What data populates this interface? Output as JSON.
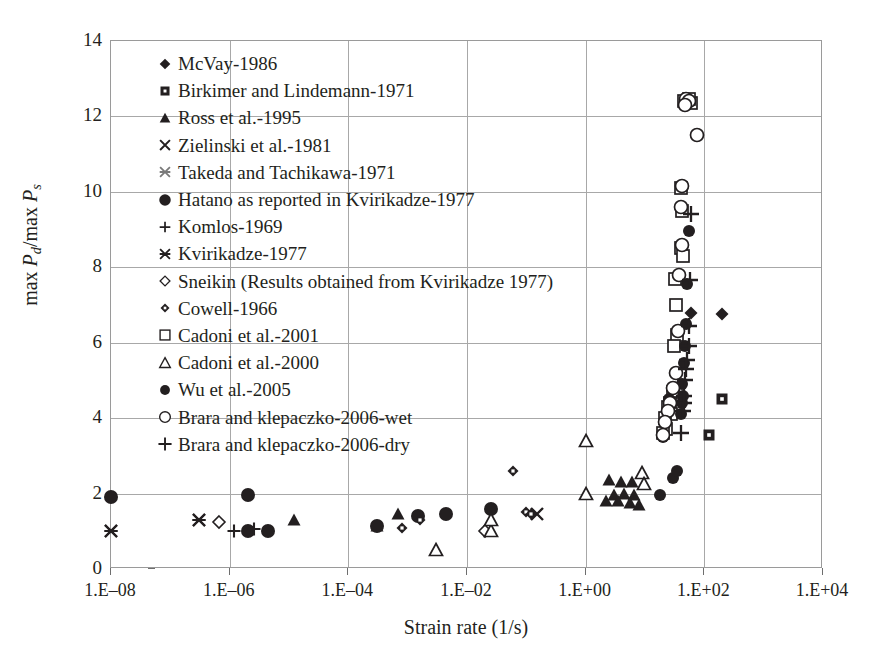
{
  "chart_data": {
    "type": "scatter",
    "title": "",
    "xlabel": "Strain rate (1/s)",
    "ylabel": "max Pd/max Ps",
    "xscale": "log",
    "yscale": "linear",
    "xlim": [
      1e-08,
      10000.0
    ],
    "ylim": [
      0,
      14
    ],
    "xticks": [
      "1.E–08",
      "1.E–06",
      "1.E–04",
      "1.E–02",
      "1.E+00",
      "1.E+02",
      "1.E+04"
    ],
    "xtick_values": [
      1e-08,
      1e-06,
      0.0001,
      0.01,
      1,
      100,
      10000
    ],
    "yticks": [
      "0",
      "2",
      "4",
      "6",
      "8",
      "10",
      "12",
      "14"
    ],
    "ytick_values": [
      0,
      2,
      4,
      6,
      8,
      10,
      12,
      14
    ],
    "grid": true,
    "legend_position": "upper-left-inside",
    "series": [
      {
        "name": "McVay-1986",
        "marker": "filled-diamond",
        "points": [
          [
            60,
            6.8
          ],
          [
            200,
            6.75
          ]
        ]
      },
      {
        "name": "Birkimer and Lindemann-1971",
        "marker": "filled-square-dot",
        "points": [
          [
            200,
            4.5
          ],
          [
            120,
            3.55
          ]
        ]
      },
      {
        "name": "Ross et al.-1995",
        "marker": "filled-triangle",
        "points": [
          [
            1.2e-05,
            1.3
          ],
          [
            0.0003,
            1.15
          ],
          [
            0.0007,
            1.45
          ],
          [
            2.5,
            2.35
          ],
          [
            4.0,
            2.3
          ],
          [
            6.0,
            2.3
          ],
          [
            3.0,
            1.95
          ],
          [
            4.5,
            2.0
          ],
          [
            6.5,
            1.95
          ],
          [
            2.2,
            1.8
          ],
          [
            3.5,
            1.8
          ],
          [
            5.5,
            1.75
          ],
          [
            8.0,
            1.7
          ]
        ]
      },
      {
        "name": "Zielinski et al.-1981",
        "marker": "cross-x",
        "points": [
          [
            0.15,
            1.45
          ]
        ]
      },
      {
        "name": "Takeda and Tachikawa-1971",
        "marker": "star-x",
        "points": [
          [
            1e-08,
            1.0
          ],
          [
            3e-07,
            1.3
          ]
        ]
      },
      {
        "name": "Hatano as reported in Kvirikadze-1977",
        "marker": "filled-circle-big",
        "points": [
          [
            1e-08,
            1.9
          ],
          [
            2e-06,
            1.0
          ],
          [
            4.5e-06,
            1.0
          ],
          [
            2e-06,
            1.95
          ],
          [
            0.0003,
            1.15
          ],
          [
            0.0015,
            1.4
          ],
          [
            0.0045,
            1.45
          ],
          [
            0.025,
            1.6
          ]
        ]
      },
      {
        "name": "Komlos-1969",
        "marker": "plus",
        "points": [
          [
            1.2e-06,
            1.0
          ],
          [
            2.6e-06,
            1.05
          ]
        ]
      },
      {
        "name": "Kvirikadze-1977",
        "marker": "star-x",
        "points": [
          [
            1e-08,
            1.0
          ],
          [
            3e-07,
            1.3
          ]
        ]
      },
      {
        "name": "Sneikin (Results obtained from Kvirikadze 1977)",
        "marker": "open-diamond",
        "points": [
          [
            6.5e-07,
            1.25
          ],
          [
            0.02,
            1.0
          ]
        ]
      },
      {
        "name": "Cowell-1966",
        "marker": "filled-diamond-sm",
        "points": [
          [
            0.0008,
            1.1
          ],
          [
            0.0016,
            1.3
          ],
          [
            0.1,
            1.5
          ],
          [
            0.06,
            2.6
          ],
          [
            0.12,
            1.45
          ]
        ]
      },
      {
        "name": "Cadoni et al.-2001",
        "marker": "open-square",
        "points": [
          [
            45,
            12.4
          ],
          [
            60,
            12.35
          ],
          [
            55,
            12.45
          ],
          [
            40,
            10.1
          ],
          [
            42,
            9.5
          ],
          [
            40,
            8.5
          ],
          [
            44,
            8.3
          ],
          [
            32,
            7.7
          ],
          [
            33,
            7.0
          ],
          [
            34,
            6.2
          ],
          [
            31,
            5.9
          ],
          [
            30,
            4.7
          ],
          [
            26,
            4.4
          ],
          [
            24,
            4.3
          ],
          [
            27,
            4.1
          ],
          [
            22,
            4.0
          ],
          [
            23,
            3.7
          ],
          [
            20,
            3.6
          ]
        ]
      },
      {
        "name": "Cadoni et al.-2000",
        "marker": "open-triangle",
        "points": [
          [
            0.003,
            0.5
          ],
          [
            0.025,
            1.0
          ],
          [
            0.025,
            1.3
          ],
          [
            1.0,
            3.4
          ],
          [
            1.0,
            2.0
          ],
          [
            9.0,
            2.55
          ],
          [
            9.5,
            2.25
          ]
        ]
      },
      {
        "name": "Wu et al.-2005",
        "marker": "filled-circle",
        "points": [
          [
            18,
            1.95
          ],
          [
            30,
            2.4
          ],
          [
            35,
            2.6
          ],
          [
            40,
            4.1
          ],
          [
            42,
            4.4
          ],
          [
            44,
            4.6
          ],
          [
            42,
            4.9
          ],
          [
            46,
            5.45
          ],
          [
            48,
            5.9
          ],
          [
            50,
            6.5
          ],
          [
            52,
            7.55
          ],
          [
            55,
            8.95
          ],
          [
            20,
            3.5
          ],
          [
            25,
            4.5
          ]
        ]
      },
      {
        "name": "Brara and klepaczko-2006-wet",
        "marker": "open-circle",
        "points": [
          [
            50,
            12.45
          ],
          [
            55,
            12.4
          ],
          [
            48,
            12.3
          ],
          [
            75,
            11.5
          ],
          [
            42,
            10.15
          ],
          [
            40,
            9.6
          ],
          [
            42,
            8.6
          ],
          [
            38,
            7.8
          ],
          [
            36,
            6.3
          ],
          [
            33,
            5.2
          ],
          [
            30,
            4.8
          ],
          [
            26,
            4.4
          ],
          [
            24,
            4.2
          ],
          [
            22,
            3.9
          ],
          [
            20,
            3.55
          ]
        ]
      },
      {
        "name": "Brara and klepaczko-2006-dry",
        "marker": "plus-big",
        "points": [
          [
            60,
            9.4
          ],
          [
            58,
            7.65
          ],
          [
            55,
            6.45
          ],
          [
            56,
            5.9
          ],
          [
            52,
            5.55
          ],
          [
            50,
            5.3
          ],
          [
            48,
            5.0
          ],
          [
            46,
            4.6
          ],
          [
            45,
            4.4
          ],
          [
            44,
            4.2
          ],
          [
            40,
            3.6
          ]
        ]
      }
    ]
  },
  "legend": {
    "items": [
      {
        "label": "McVay-1986",
        "marker": "filled-diamond"
      },
      {
        "label": "Birkimer and Lindemann-1971",
        "marker": "filled-square-dot"
      },
      {
        "label": "Ross et al.-1995",
        "marker": "filled-triangle"
      },
      {
        "label": "Zielinski et al.-1981",
        "marker": "cross-x"
      },
      {
        "label": "Takeda and Tachikawa-1971",
        "marker": "star-x-gray"
      },
      {
        "label": "Hatano as reported in Kvirikadze-1977",
        "marker": "filled-circle-big"
      },
      {
        "label": "Komlos-1969",
        "marker": "plus"
      },
      {
        "label": "Kvirikadze-1977",
        "marker": "star-x"
      },
      {
        "label": "Sneikin (Results obtained from Kvirikadze 1977)",
        "marker": "open-diamond"
      },
      {
        "label": "Cowell-1966",
        "marker": "filled-diamond-sm"
      },
      {
        "label": "Cadoni et al.-2001",
        "marker": "open-square"
      },
      {
        "label": "Cadoni et al.-2000",
        "marker": "open-triangle"
      },
      {
        "label": "Wu et al.-2005",
        "marker": "filled-circle"
      },
      {
        "label": "Brara and klepaczko-2006-wet",
        "marker": "open-circle"
      },
      {
        "label": "Brara and klepaczko-2006-dry",
        "marker": "plus-big"
      }
    ]
  },
  "axes": {
    "y_title_prefix": "max ",
    "y_title_p1": "P",
    "y_title_sub1": "d",
    "y_title_mid": "/max ",
    "y_title_p2": "P",
    "y_title_sub2": "s",
    "x_title": "Strain rate (1/s)"
  },
  "colors": {
    "ink": "#231f20",
    "grid": "#a8a8a8",
    "frame": "#9a9a9a",
    "background": "#ffffff",
    "gray_marker": "#7a7a7a"
  }
}
